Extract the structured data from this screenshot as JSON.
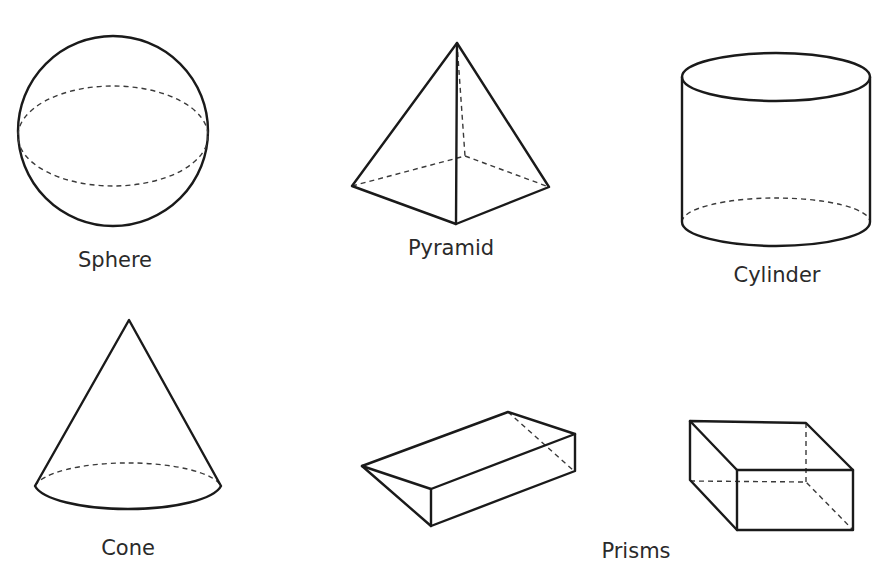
{
  "diagram": {
    "shapes": [
      {
        "id": "sphere",
        "label": "Sphere"
      },
      {
        "id": "pyramid",
        "label": "Pyramid"
      },
      {
        "id": "cylinder",
        "label": "Cylinder"
      },
      {
        "id": "cone",
        "label": "Cone"
      },
      {
        "id": "prisms",
        "label": "Prisms"
      }
    ],
    "colors": {
      "stroke": "#1a1a1a",
      "hidden_stroke": "#3a3a3a",
      "background": "#ffffff",
      "text": "#2a2a2a"
    }
  }
}
